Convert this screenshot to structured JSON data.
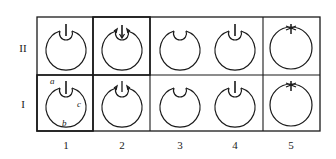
{
  "figure": {
    "rows": [
      {
        "label": "II",
        "cells": [
          {
            "column": "1",
            "variant": "inner-loop-with-stem"
          },
          {
            "column": "2",
            "variant": "inner-loop-with-arrows"
          },
          {
            "column": "3",
            "variant": "inner-loop-no-stem"
          },
          {
            "column": "4",
            "variant": "inner-loop-with-stem"
          },
          {
            "column": "5",
            "variant": "single-circle-with-star"
          }
        ]
      },
      {
        "label": "I",
        "cells": [
          {
            "column": "1",
            "variant": "inner-loop-with-stem-labeled",
            "annotations": [
              "a",
              "b",
              "c"
            ]
          },
          {
            "column": "2",
            "variant": "inner-loop-with-arrows"
          },
          {
            "column": "3",
            "variant": "inner-loop-no-stem"
          },
          {
            "column": "4",
            "variant": "inner-loop-with-stem"
          },
          {
            "column": "5",
            "variant": "single-circle-with-star"
          }
        ]
      }
    ],
    "column_labels": [
      "1",
      "2",
      "3",
      "4",
      "5"
    ],
    "annotations": {
      "a": "a",
      "b": "b",
      "c": "c"
    },
    "colors": {
      "line": "#1a1a1a",
      "background": "#ffffff"
    }
  }
}
